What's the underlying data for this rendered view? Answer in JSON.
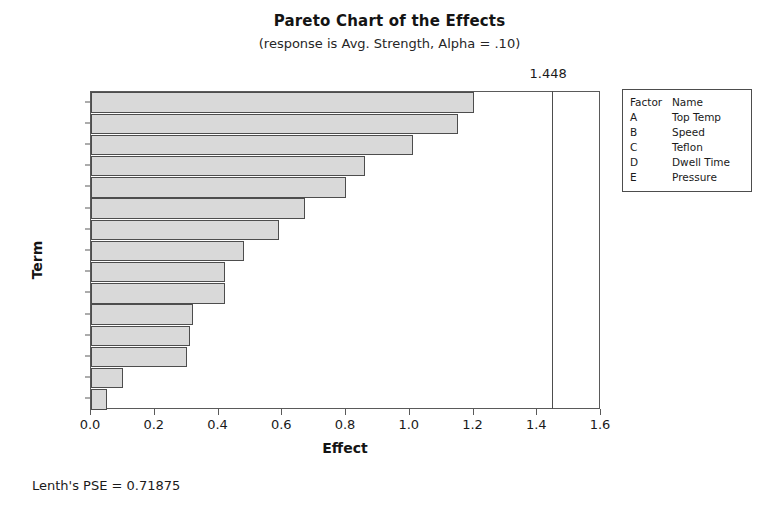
{
  "chart_data": {
    "type": "bar",
    "orientation": "horizontal",
    "title": "Pareto Chart of the Effects",
    "subtitle": "(response is Avg. Strength, Alpha = .10)",
    "xlabel": "Effect",
    "ylabel": "Term",
    "xlim": [
      0.0,
      1.6
    ],
    "xticks": [
      "0.0",
      "0.2",
      "0.4",
      "0.6",
      "0.8",
      "1.0",
      "1.2",
      "1.4",
      "1.6"
    ],
    "xtick_values": [
      0.0,
      0.2,
      0.4,
      0.6,
      0.8,
      1.0,
      1.2,
      1.4,
      1.6
    ],
    "grid": false,
    "categories": [
      "AB",
      "C",
      "CD",
      "AC",
      "BE",
      "A",
      "D",
      "DE",
      "BC",
      "BD",
      "AE",
      "AD",
      "E",
      "B",
      "CE"
    ],
    "values": [
      1.2,
      1.15,
      1.01,
      0.86,
      0.8,
      0.67,
      0.59,
      0.48,
      0.42,
      0.42,
      0.32,
      0.31,
      0.3,
      0.1,
      0.05
    ],
    "reference_line": {
      "value": 1.448,
      "label": "1.448"
    },
    "bar_fill_color": "#d9d9d9",
    "bar_border_color": "#4d4d4d",
    "legend_position": "right",
    "annotations": [
      "Lenth's PSE = 0.71875"
    ]
  },
  "legend": {
    "header": {
      "factor": "Factor",
      "name": "Name"
    },
    "rows": [
      {
        "factor": "A",
        "name": "Top Temp"
      },
      {
        "factor": "B",
        "name": "Speed"
      },
      {
        "factor": "C",
        "name": "Teflon"
      },
      {
        "factor": "D",
        "name": "Dwell Time"
      },
      {
        "factor": "E",
        "name": "Pressure"
      }
    ]
  },
  "footnote": "Lenth's PSE = 0.71875"
}
